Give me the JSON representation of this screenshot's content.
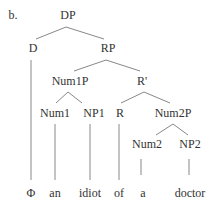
{
  "example_label": "b.",
  "nodes": {
    "dp": {
      "label": "DP",
      "x": 68,
      "y": 15
    },
    "d": {
      "label": "D",
      "x": 33,
      "y": 48
    },
    "rp": {
      "label": "RP",
      "x": 108,
      "y": 48
    },
    "num1p": {
      "label": "Num1P",
      "x": 70,
      "y": 81
    },
    "rbar": {
      "label": "R'",
      "x": 142,
      "y": 81
    },
    "num1": {
      "label": "Num1",
      "x": 55,
      "y": 113
    },
    "np1": {
      "label": "NP1",
      "x": 94,
      "y": 113
    },
    "r": {
      "label": "R",
      "x": 120,
      "y": 113
    },
    "num2p": {
      "label": "Num2P",
      "x": 173,
      "y": 113
    },
    "num2": {
      "label": "Num2",
      "x": 147,
      "y": 144
    },
    "np2": {
      "label": "NP2",
      "x": 190,
      "y": 144
    }
  },
  "leaves": [
    {
      "label": "Φ",
      "x": 31,
      "y": 193
    },
    {
      "label": "an",
      "x": 55,
      "y": 193
    },
    {
      "label": "idiot",
      "x": 90,
      "y": 193
    },
    {
      "label": "of",
      "x": 119,
      "y": 193
    },
    {
      "label": "a",
      "x": 143,
      "y": 193
    },
    {
      "label": "doctor",
      "x": 190,
      "y": 193
    }
  ],
  "line_color": "#777777"
}
